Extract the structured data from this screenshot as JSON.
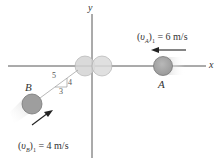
{
  "diagram": {
    "type": "collision-diagram",
    "axes": {
      "x_label": "x",
      "y_label": "y",
      "origin": [
        92,
        66
      ]
    },
    "balls": [
      {
        "id": "A",
        "label": "A",
        "cx": 163,
        "cy": 66,
        "r": 10,
        "fill": "#a8a8a8"
      },
      {
        "id": "B",
        "label": "B",
        "cx": 32,
        "cy": 104,
        "r": 10,
        "fill": "#a0a0a0"
      }
    ],
    "collision_ghosts": [
      {
        "cx": 85,
        "cy": 66,
        "r": 10,
        "fill": "#d6d6d6"
      },
      {
        "cx": 102,
        "cy": 66,
        "r": 10,
        "fill": "#dcdcdc"
      }
    ],
    "velocities": {
      "A": {
        "text": "(υA)1 = 6 m/s",
        "prefix": "(",
        "symbol": "υ",
        "sub_body": "A",
        "suffix": ")",
        "sub_index": "1",
        "value": " = 6 m/s",
        "direction": "left"
      },
      "B": {
        "text": "(υB)1 = 4 m/s",
        "prefix": "(",
        "symbol": "υ",
        "sub_body": "B",
        "suffix": ")",
        "sub_index": "1",
        "value": " = 4 m/s",
        "direction": "up-right"
      }
    },
    "slope_triangle": {
      "hypotenuse": "5",
      "vertical": "4",
      "horizontal": "3"
    },
    "colors": {
      "axis": "#444444",
      "arrow": "#222222",
      "ball_stroke": "#777777",
      "guide_line": "#999999"
    }
  }
}
